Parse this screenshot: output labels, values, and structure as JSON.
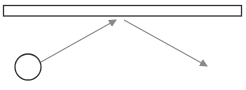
{
  "diagram": {
    "colors": {
      "shape_stroke": "#333333",
      "arrow_stroke": "#8a8a8a",
      "background": "#ffffff"
    },
    "shapes": [
      {
        "id": "bar",
        "type": "rectangle",
        "x": 3.5,
        "y": 5.5,
        "width": 238,
        "height": 10.5
      },
      {
        "id": "node",
        "type": "circle",
        "cx": 28,
        "cy": 67,
        "r": 13
      }
    ],
    "arrows": [
      {
        "id": "arrow-1",
        "from": [
          41,
          62
        ],
        "to": [
          116,
          20
        ]
      },
      {
        "id": "arrow-2",
        "from": [
          124,
          20
        ],
        "to": [
          207,
          66
        ]
      }
    ]
  }
}
